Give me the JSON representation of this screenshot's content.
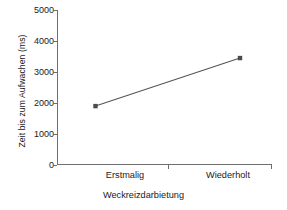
{
  "chart_data": {
    "type": "line",
    "title": "",
    "xlabel": "Weckreizdarbietung",
    "ylabel": "Zeit bis zum Aufwachen (ms)",
    "categories": [
      "Erstmalig",
      "Wiederholt"
    ],
    "values": [
      1900,
      3450
    ],
    "series": [
      {
        "name": "Zeit bis zum Aufwachen",
        "values": [
          1900,
          3450
        ]
      }
    ],
    "ylim": [
      0,
      5000
    ],
    "yticks": [
      0,
      1000,
      2000,
      3000,
      4000,
      5000
    ],
    "ytick_labels": [
      "0",
      "1000",
      "2000",
      "3000",
      "4000",
      "5000"
    ],
    "xticks": [
      "Erstmalig",
      "Wiederholt"
    ],
    "grid": false,
    "legend": false,
    "marker": "square",
    "line_color": "#55555a",
    "marker_color": "#4a4a50",
    "axis_color": "#6e6e6e",
    "background": "#ffffff"
  }
}
